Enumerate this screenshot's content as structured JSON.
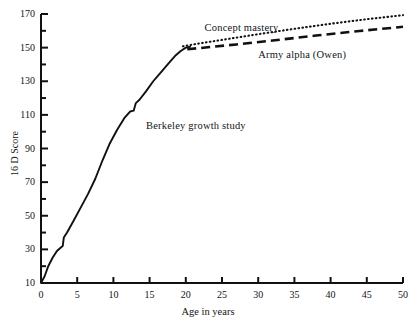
{
  "chart_data": {
    "type": "line",
    "title": "",
    "xlabel": "Age in years",
    "ylabel": "16 D Score",
    "xlim": [
      0,
      50
    ],
    "ylim": [
      10,
      170
    ],
    "grid": false,
    "legend": "inline-annotations",
    "xticks": [
      0,
      5,
      10,
      15,
      20,
      25,
      30,
      35,
      40,
      45,
      50
    ],
    "xtick_labels": [
      "0",
      "5",
      "10",
      "15",
      "20",
      "25",
      "30",
      "35",
      "40",
      "45",
      "50"
    ],
    "yticks": [
      10,
      30,
      50,
      70,
      90,
      110,
      130,
      150,
      170
    ],
    "ytick_labels": [
      "10",
      "30",
      "50",
      "70",
      "90",
      "110",
      "130",
      "150",
      "170"
    ],
    "yticks_minor": [
      20,
      40,
      60,
      80,
      100,
      120,
      140,
      160
    ],
    "series": [
      {
        "name": "Berkeley growth study",
        "style": "solid",
        "color": "#111111",
        "label_x": 14.5,
        "label_y": 103,
        "points": [
          [
            0,
            10
          ],
          [
            0.5,
            14
          ],
          [
            1.0,
            20
          ],
          [
            1.6,
            25
          ],
          [
            2.2,
            29
          ],
          [
            2.7,
            31
          ],
          [
            3.0,
            32
          ],
          [
            3.15,
            37
          ],
          [
            3.6,
            40
          ],
          [
            4.5,
            47
          ],
          [
            5.5,
            55
          ],
          [
            6.5,
            63
          ],
          [
            7.5,
            72
          ],
          [
            8.5,
            83
          ],
          [
            9.5,
            93
          ],
          [
            10.5,
            101
          ],
          [
            11.5,
            108
          ],
          [
            12.3,
            112
          ],
          [
            12.8,
            112.5
          ],
          [
            13.1,
            117
          ],
          [
            13.6,
            119
          ],
          [
            14.5,
            124
          ],
          [
            15.5,
            130
          ],
          [
            16.5,
            135
          ],
          [
            17.5,
            140
          ],
          [
            18.5,
            145
          ],
          [
            19.3,
            148
          ],
          [
            20.0,
            150
          ],
          [
            20.6,
            150.5
          ]
        ]
      },
      {
        "name": "Concept mastery",
        "style": "dotted",
        "color": "#111111",
        "label_x": 22.6,
        "label_y": 161,
        "points": [
          [
            19.6,
            150.8
          ],
          [
            22,
            152.6
          ],
          [
            25,
            154.6
          ],
          [
            30,
            158.0
          ],
          [
            35,
            161.2
          ],
          [
            40,
            164.2
          ],
          [
            45,
            166.9
          ],
          [
            50,
            169.3
          ]
        ]
      },
      {
        "name": "Army alpha (Owen)",
        "style": "dashed",
        "color": "#111111",
        "label_x": 30.0,
        "label_y": 145,
        "points": [
          [
            20.2,
            149.0
          ],
          [
            23,
            150.2
          ],
          [
            27,
            151.9
          ],
          [
            32,
            154.2
          ],
          [
            38,
            157.2
          ],
          [
            44,
            159.9
          ],
          [
            50,
            162.4
          ]
        ]
      }
    ],
    "annotations": [
      {
        "text": "Berkeley growth study",
        "x": 14.5,
        "y": 103
      },
      {
        "text": "Concept mastery",
        "x": 22.6,
        "y": 161
      },
      {
        "text": "Army alpha (Owen)",
        "x": 30.0,
        "y": 145
      }
    ]
  },
  "axes": {
    "x_title": "Age in years",
    "y_title": "16 D Score"
  }
}
